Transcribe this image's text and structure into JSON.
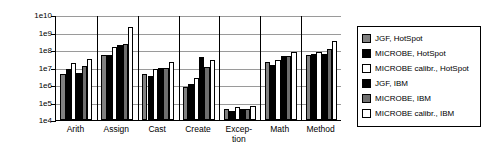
{
  "chart_data": {
    "type": "bar",
    "title": "",
    "xlabel": "",
    "ylabel": "",
    "yscale": "log",
    "ylim": [
      10000,
      10000000000
    ],
    "grid": true,
    "legend_position": "right",
    "ytick_labels": [
      "1e10",
      "1e9",
      "1e8",
      "1e7",
      "1e6",
      "1e5",
      "1e4"
    ],
    "ytick_values": [
      10000000000,
      1000000000,
      100000000,
      10000000,
      1000000,
      100000,
      10000
    ],
    "categories": [
      "Arith",
      "Assign",
      "Cast",
      "Create",
      "Excep-\ntion",
      "Math",
      "Method"
    ],
    "category_names": [
      "Arith",
      "Assign",
      "Cast",
      "Create",
      "Exception",
      "Math",
      "Method"
    ],
    "series": [
      {
        "name": "JGF, HotSpot",
        "color": "#808080",
        "values": [
          4500000,
          55000000,
          4100000,
          800000,
          42000,
          20000000,
          55000000
        ]
      },
      {
        "name": "MICROBE, HotSpot",
        "color": "#000000",
        "values": [
          8500000,
          52000000,
          3200000,
          1200000,
          33000,
          14000000,
          60000000
        ]
      },
      {
        "name": "MICROBE calibr., HotSpot",
        "color": "#ffffff",
        "values": [
          18000000,
          150000000,
          8000000,
          2400000,
          56000,
          28000000,
          78000000
        ]
      },
      {
        "name": "JGF, IBM",
        "color": "#000000",
        "values": [
          4600000,
          190000000,
          9000000,
          41000000,
          41000,
          48000000,
          58000000
        ]
      },
      {
        "name": "MICROBE, IBM",
        "color": "#6e6e6e",
        "values": [
          12000000,
          210000000,
          9200000,
          11000000,
          42000,
          45000000,
          110000000
        ]
      },
      {
        "name": "MICROBE calibr., IBM",
        "color": "#ffffff",
        "values": [
          32000000,
          2200000000,
          21000000,
          26000000,
          64000,
          75000000,
          330000000
        ]
      }
    ]
  },
  "legend": {
    "items": [
      {
        "label": "JGF, HotSpot",
        "color": "#808080"
      },
      {
        "label": "MICROBE, HotSpot",
        "color": "#000000"
      },
      {
        "label": "MICROBE calibr., HotSpot",
        "color": "#ffffff"
      },
      {
        "label": "JGF, IBM",
        "color": "#000000"
      },
      {
        "label": "MICROBE, IBM",
        "color": "#6e6e6e"
      },
      {
        "label": "MICROBE calibr., IBM",
        "color": "#ffffff"
      }
    ]
  }
}
